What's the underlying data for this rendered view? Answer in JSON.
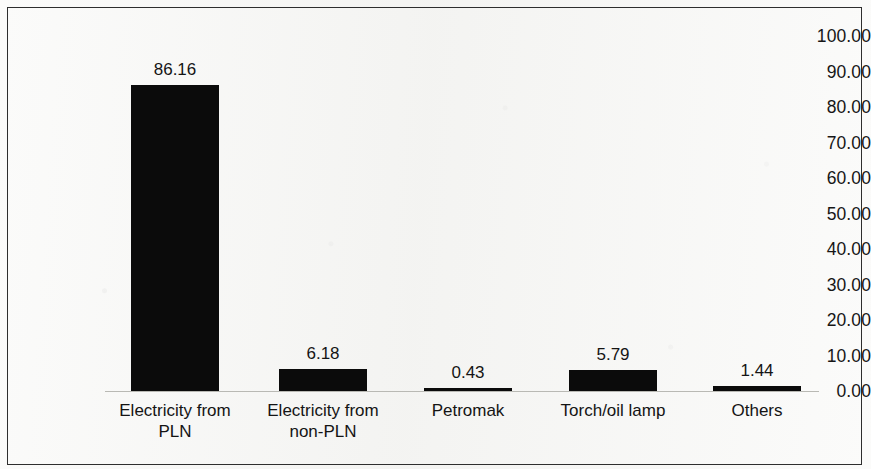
{
  "chart_data": {
    "type": "bar",
    "title": "",
    "subtitle": "",
    "xlabel": "",
    "ylabel": "",
    "categories": [
      "Electricity from PLN",
      "Electricity from non-PLN",
      "Petromak",
      "Torch/oil lamp",
      "Others"
    ],
    "category_lines": [
      [
        "Electricity from",
        "PLN"
      ],
      [
        "Electricity from",
        "non-PLN"
      ],
      [
        "Petromak"
      ],
      [
        "Torch/oil lamp"
      ],
      [
        "Others"
      ]
    ],
    "values": [
      86.16,
      6.18,
      0.43,
      5.79,
      1.44
    ],
    "value_labels": [
      "86.16",
      "6.18",
      "0.43",
      "5.79",
      "1.44"
    ],
    "ylim": [
      0,
      100
    ],
    "ytick_values": [
      100,
      90,
      80,
      70,
      60,
      50,
      40,
      30,
      20,
      10,
      0
    ],
    "ytick_labels": [
      "100.00",
      "90.00",
      "80.00",
      "70.00",
      "60.00",
      "50.00",
      "40.00",
      "30.00",
      "20.00",
      "10.00",
      "0.00"
    ],
    "grid": false,
    "legend": null,
    "bar_color": "#0b0b0b",
    "axis_color": "#b9b9b4",
    "text_color": "#141414"
  }
}
